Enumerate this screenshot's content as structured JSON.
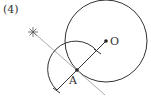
{
  "problem_label": "(4)",
  "points": {
    "O": {
      "label": "O",
      "x": 106,
      "y": 41
    },
    "A": {
      "label": "A",
      "x": 77,
      "y": 70
    }
  },
  "circle_O": {
    "cx": 106,
    "cy": 41,
    "r": 41
  },
  "arc_A": {
    "cx": 77,
    "cy": 70,
    "r": 28
  },
  "colors": {
    "stroke": "#333333",
    "construction": "#aaaaaa"
  }
}
